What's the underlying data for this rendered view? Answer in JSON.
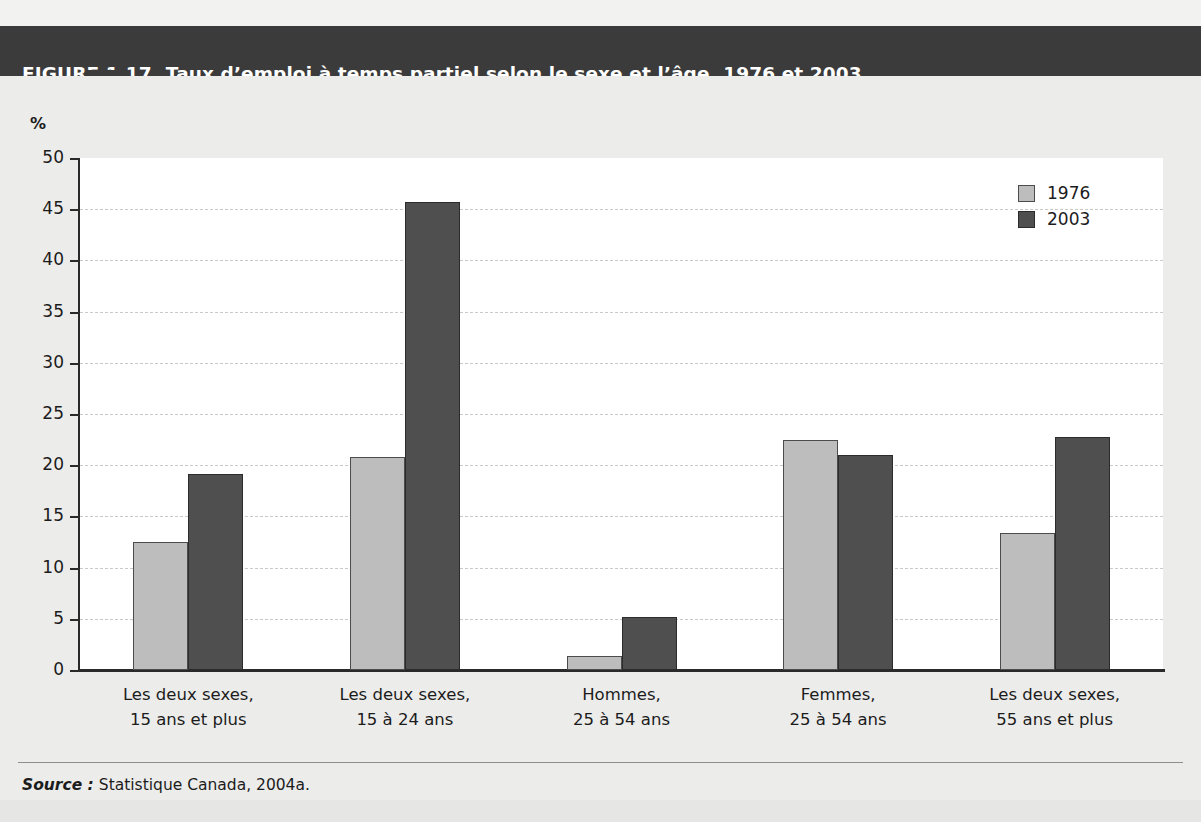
{
  "figure": {
    "number": "FIGURE 1.17",
    "title": "Taux d’emploi à temps partiel selon le sexe et l’âge, 1976 et 2003",
    "source_keyword": "Source :",
    "source_text": "Statistique Canada, 2004a."
  },
  "colors": {
    "header_band": "#3b3b3b",
    "series_1976": "#bdbdbd",
    "series_2003": "#4f4f4f",
    "plot_background": "#ffffff",
    "page_background": "#ececeb",
    "gridline": "#c9c9c9"
  },
  "chart_data": {
    "type": "bar",
    "title": "Taux d’emploi à temps partiel selon le sexe et l’âge, 1976 et 2003",
    "xlabel": "",
    "ylabel": "%",
    "ylim": [
      0,
      50
    ],
    "yticks": [
      0,
      5,
      10,
      15,
      20,
      25,
      30,
      35,
      40,
      45,
      50
    ],
    "ytick_labels": [
      "0",
      "5",
      "10",
      "15",
      "20",
      "25",
      "30",
      "35",
      "40",
      "45",
      "50"
    ],
    "grid": true,
    "legend_position": "top-right",
    "categories": [
      "Les deux sexes, 15 ans et plus",
      "Les deux sexes, 15 à 24 ans",
      "Hommes, 25 à 54 ans",
      "Femmes, 25 à 54 ans",
      "Les deux sexes, 55 ans et plus"
    ],
    "category_lines": [
      [
        "Les deux sexes,",
        "15 ans et plus"
      ],
      [
        "Les deux sexes,",
        "15 à 24 ans"
      ],
      [
        "Hommes,",
        "25 à 54 ans"
      ],
      [
        "Femmes,",
        "25 à 54 ans"
      ],
      [
        "Les deux sexes,",
        "55 ans et plus"
      ]
    ],
    "series": [
      {
        "name": "1976",
        "color": "#bdbdbd",
        "values": [
          12.5,
          20.8,
          1.4,
          22.5,
          13.4
        ]
      },
      {
        "name": "2003",
        "color": "#4f4f4f",
        "values": [
          19.1,
          45.7,
          5.2,
          21.0,
          22.8
        ]
      }
    ]
  }
}
